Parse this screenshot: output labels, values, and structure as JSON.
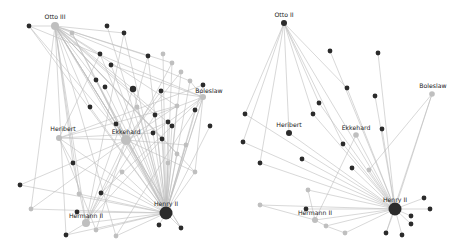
{
  "colors": {
    "dark_node": "#2b2b2b",
    "light_node": "#bfbfbf",
    "edge": "#bdbdbd",
    "background": "#ffffff"
  },
  "left_network": {
    "labels": {
      "otto": "Otto III",
      "boleslaw": "Boleslaw",
      "heribert": "Heribert",
      "ekkehard": "Ekkehard",
      "hermann": "Hermann II",
      "henry": "Henry II"
    },
    "nodes": [
      {
        "id": "otto",
        "x": 55,
        "y": 26,
        "r": 4,
        "c": "light",
        "label": "otto"
      },
      {
        "id": "henry",
        "x": 166,
        "y": 213,
        "r": 6.5,
        "c": "dark",
        "label": "henry"
      },
      {
        "id": "ekk",
        "x": 126,
        "y": 140,
        "r": 5,
        "c": "light",
        "label": "ekkehard"
      },
      {
        "id": "her",
        "x": 59,
        "y": 138,
        "r": 3,
        "c": "light",
        "label": "heribert"
      },
      {
        "id": "herm",
        "x": 86,
        "y": 223,
        "r": 4,
        "c": "light",
        "label": "hermann"
      },
      {
        "id": "bol",
        "x": 203,
        "y": 97,
        "r": 3,
        "c": "light",
        "label": "boleslaw"
      },
      {
        "id": "a1",
        "x": 29,
        "y": 26,
        "r": 2.4,
        "c": "dark"
      },
      {
        "id": "a2",
        "x": 107,
        "y": 26,
        "r": 2.4,
        "c": "dark"
      },
      {
        "id": "a3",
        "x": 124,
        "y": 33,
        "r": 2.4,
        "c": "dark"
      },
      {
        "id": "a4",
        "x": 72,
        "y": 33,
        "r": 2.4,
        "c": "light"
      },
      {
        "id": "a5",
        "x": 100,
        "y": 54,
        "r": 2.4,
        "c": "dark"
      },
      {
        "id": "a6",
        "x": 111,
        "y": 65,
        "r": 2.4,
        "c": "dark"
      },
      {
        "id": "a7",
        "x": 148,
        "y": 56,
        "r": 2.4,
        "c": "dark"
      },
      {
        "id": "a8",
        "x": 163,
        "y": 54,
        "r": 2.4,
        "c": "light"
      },
      {
        "id": "a9",
        "x": 172,
        "y": 63,
        "r": 2.4,
        "c": "light"
      },
      {
        "id": "a10",
        "x": 181,
        "y": 72,
        "r": 2.4,
        "c": "light"
      },
      {
        "id": "a11",
        "x": 190,
        "y": 81,
        "r": 2.4,
        "c": "light"
      },
      {
        "id": "a12",
        "x": 203,
        "y": 85,
        "r": 2.4,
        "c": "dark"
      },
      {
        "id": "a13",
        "x": 96,
        "y": 80,
        "r": 2.4,
        "c": "dark"
      },
      {
        "id": "a14",
        "x": 105,
        "y": 87,
        "r": 2.4,
        "c": "dark"
      },
      {
        "id": "a15",
        "x": 133,
        "y": 89,
        "r": 3.2,
        "c": "dark"
      },
      {
        "id": "a16",
        "x": 161,
        "y": 91,
        "r": 2.4,
        "c": "dark"
      },
      {
        "id": "a17",
        "x": 90,
        "y": 107,
        "r": 2.4,
        "c": "dark"
      },
      {
        "id": "a18",
        "x": 137,
        "y": 107,
        "r": 2.4,
        "c": "light"
      },
      {
        "id": "a19",
        "x": 177,
        "y": 106,
        "r": 2.4,
        "c": "light"
      },
      {
        "id": "a20",
        "x": 195,
        "y": 110,
        "r": 2.4,
        "c": "dark"
      },
      {
        "id": "a21",
        "x": 155,
        "y": 115,
        "r": 2.4,
        "c": "dark"
      },
      {
        "id": "a22",
        "x": 168,
        "y": 122,
        "r": 2.4,
        "c": "dark"
      },
      {
        "id": "a23",
        "x": 172,
        "y": 126,
        "r": 2.4,
        "c": "dark"
      },
      {
        "id": "a24",
        "x": 210,
        "y": 126,
        "r": 2.4,
        "c": "dark"
      },
      {
        "id": "a25",
        "x": 116,
        "y": 124,
        "r": 2.4,
        "c": "dark"
      },
      {
        "id": "a26",
        "x": 153,
        "y": 133,
        "r": 2.4,
        "c": "dark"
      },
      {
        "id": "a27",
        "x": 162,
        "y": 139,
        "r": 2.4,
        "c": "dark"
      },
      {
        "id": "a28",
        "x": 186,
        "y": 145,
        "r": 2.4,
        "c": "light"
      },
      {
        "id": "a29",
        "x": 177,
        "y": 154,
        "r": 2.4,
        "c": "light"
      },
      {
        "id": "a30",
        "x": 168,
        "y": 163,
        "r": 2.4,
        "c": "light"
      },
      {
        "id": "a31",
        "x": 195,
        "y": 172,
        "r": 2.4,
        "c": "light"
      },
      {
        "id": "a32",
        "x": 122,
        "y": 172,
        "r": 2.4,
        "c": "light"
      },
      {
        "id": "a33",
        "x": 73,
        "y": 163,
        "r": 2.4,
        "c": "dark"
      },
      {
        "id": "a34",
        "x": 20,
        "y": 185,
        "r": 2.4,
        "c": "dark"
      },
      {
        "id": "a35",
        "x": 79,
        "y": 194,
        "r": 2.4,
        "c": "light"
      },
      {
        "id": "a36",
        "x": 101,
        "y": 193,
        "r": 2.4,
        "c": "dark"
      },
      {
        "id": "a37",
        "x": 31,
        "y": 209,
        "r": 2.4,
        "c": "light"
      },
      {
        "id": "a38",
        "x": 77,
        "y": 212,
        "r": 2.4,
        "c": "dark"
      },
      {
        "id": "a39",
        "x": 66,
        "y": 235,
        "r": 2.4,
        "c": "dark"
      },
      {
        "id": "a40",
        "x": 96,
        "y": 230,
        "r": 2.4,
        "c": "light"
      },
      {
        "id": "a41",
        "x": 116,
        "y": 236,
        "r": 2.4,
        "c": "light"
      },
      {
        "id": "a42",
        "x": 159,
        "y": 225,
        "r": 2.4,
        "c": "dark"
      },
      {
        "id": "a43",
        "x": 181,
        "y": 228,
        "r": 2.4,
        "c": "dark"
      }
    ]
  },
  "right_network": {
    "labels": {
      "otto": "Otto II",
      "boleslaw": "Boleslaw",
      "heribert": "Heribert",
      "ekkehard": "Ekkehard",
      "hermann": "Hermann II",
      "henry": "Henry II"
    },
    "nodes": [
      {
        "id": "otto",
        "x": 284,
        "y": 23,
        "r": 3,
        "c": "dark",
        "label": "otto"
      },
      {
        "id": "henry",
        "x": 395,
        "y": 209,
        "r": 6.5,
        "c": "dark",
        "label": "henry"
      },
      {
        "id": "ekk",
        "x": 356,
        "y": 135,
        "r": 2.8,
        "c": "light",
        "label": "ekkehard"
      },
      {
        "id": "her",
        "x": 289,
        "y": 133,
        "r": 3,
        "c": "dark",
        "label": "heribert"
      },
      {
        "id": "herm",
        "x": 315,
        "y": 220,
        "r": 3,
        "c": "light",
        "label": "hermann"
      },
      {
        "id": "bol",
        "x": 432,
        "y": 94,
        "r": 2.8,
        "c": "light",
        "label": "boleslaw"
      },
      {
        "id": "b1",
        "x": 330,
        "y": 51,
        "r": 2.4,
        "c": "dark"
      },
      {
        "id": "b2",
        "x": 378,
        "y": 53,
        "r": 2.4,
        "c": "dark"
      },
      {
        "id": "b3",
        "x": 347,
        "y": 88,
        "r": 2.4,
        "c": "dark"
      },
      {
        "id": "b4",
        "x": 375,
        "y": 96,
        "r": 2.4,
        "c": "dark"
      },
      {
        "id": "b5",
        "x": 319,
        "y": 103,
        "r": 2.4,
        "c": "dark"
      },
      {
        "id": "b6",
        "x": 245,
        "y": 114,
        "r": 2.4,
        "c": "dark"
      },
      {
        "id": "b7",
        "x": 313,
        "y": 114,
        "r": 2.4,
        "c": "dark"
      },
      {
        "id": "b8",
        "x": 382,
        "y": 129,
        "r": 2.4,
        "c": "dark"
      },
      {
        "id": "b9",
        "x": 243,
        "y": 142,
        "r": 2.4,
        "c": "dark"
      },
      {
        "id": "b10",
        "x": 343,
        "y": 144,
        "r": 2.4,
        "c": "dark"
      },
      {
        "id": "b11",
        "x": 260,
        "y": 163,
        "r": 2.4,
        "c": "dark"
      },
      {
        "id": "b12",
        "x": 302,
        "y": 159,
        "r": 2.4,
        "c": "dark"
      },
      {
        "id": "b13",
        "x": 352,
        "y": 168,
        "r": 2.4,
        "c": "dark"
      },
      {
        "id": "b14",
        "x": 369,
        "y": 170,
        "r": 2.4,
        "c": "light"
      },
      {
        "id": "b15",
        "x": 308,
        "y": 190,
        "r": 2.4,
        "c": "light"
      },
      {
        "id": "b16",
        "x": 260,
        "y": 205,
        "r": 2.4,
        "c": "light"
      },
      {
        "id": "b17",
        "x": 306,
        "y": 209,
        "r": 2.4,
        "c": "dark"
      },
      {
        "id": "b18",
        "x": 326,
        "y": 226,
        "r": 2.4,
        "c": "light"
      },
      {
        "id": "b19",
        "x": 345,
        "y": 233,
        "r": 2.4,
        "c": "light"
      },
      {
        "id": "b20",
        "x": 424,
        "y": 198,
        "r": 2.4,
        "c": "dark"
      },
      {
        "id": "b21",
        "x": 430,
        "y": 209,
        "r": 2.4,
        "c": "dark"
      },
      {
        "id": "b22",
        "x": 411,
        "y": 216,
        "r": 2.4,
        "c": "dark"
      },
      {
        "id": "b23",
        "x": 411,
        "y": 224,
        "r": 2.4,
        "c": "dark"
      },
      {
        "id": "b24",
        "x": 386,
        "y": 233,
        "r": 2.4,
        "c": "dark"
      },
      {
        "id": "b25",
        "x": 402,
        "y": 235,
        "r": 2.4,
        "c": "dark"
      }
    ]
  }
}
